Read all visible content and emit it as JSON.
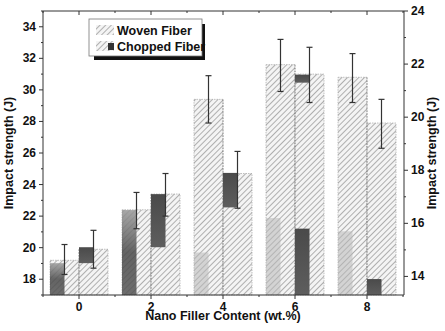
{
  "chart_data": {
    "type": "bar",
    "title": "",
    "xlabel": "Nano Filler Content (wt.%)",
    "ylabel": "Impact strength (J)",
    "ylabel_right": "Impact strength (J)",
    "categories": [
      "0",
      "2",
      "4",
      "6",
      "8"
    ],
    "ylim": [
      17,
      35
    ],
    "ylim_right": [
      13.3,
      24
    ],
    "yticks": [
      18,
      20,
      22,
      24,
      26,
      28,
      30,
      32,
      34
    ],
    "yticks_right": [
      14,
      16,
      18,
      20,
      22,
      24
    ],
    "grid": false,
    "legend_position": "upper-left",
    "series": [
      {
        "name": "Woven Fiber",
        "axis": "left",
        "values": [
          19.2,
          22.4,
          29.4,
          31.6,
          30.8
        ],
        "error_high": [
          20.2,
          23.5,
          30.9,
          33.2,
          32.3
        ],
        "error_low": [
          18.3,
          21.2,
          27.9,
          29.9,
          29.2
        ],
        "inner_overlay_right_axis": [
          14.5,
          16.5,
          14.9,
          16.2,
          15.7
        ],
        "inner_overlay_style": [
          "dark",
          "dark",
          "light",
          "light",
          "light"
        ]
      },
      {
        "name": "Chopped Fiber",
        "axis": "left",
        "values": [
          19.9,
          23.4,
          24.7,
          31.0,
          27.9
        ],
        "error_high": [
          21.1,
          24.7,
          26.1,
          32.7,
          29.4
        ],
        "error_low": [
          18.7,
          22.0,
          22.5,
          29.2,
          26.3
        ],
        "inner_dark_segments_right_axis": [
          [
            [
              14.5,
              15.1
            ]
          ],
          [
            [
              15.1,
              17.1
            ]
          ],
          [
            [
              16.6,
              17.9
            ]
          ],
          [
            [
              21.3,
              21.6
            ],
            [
              13.3,
              15.8
            ]
          ],
          [
            [
              13.3,
              13.9
            ]
          ]
        ]
      }
    ]
  },
  "legend": {
    "items": [
      {
        "label": "Woven Fiber"
      },
      {
        "label": "Chopped Fiber"
      }
    ]
  },
  "axes": {
    "x_title": "Nano Filler Content (wt.%)",
    "y_left_title": "Impact strength (J)",
    "y_right_title": "Impact strength (J)"
  },
  "colors": {
    "hatch_line": "#8a8a8a",
    "bar_fill": "#f2f2f2",
    "dark_overlay": "#3a3a3a",
    "light_overlay": "#b8b8b8",
    "error_bar": "#333333",
    "axis": "#333333"
  }
}
